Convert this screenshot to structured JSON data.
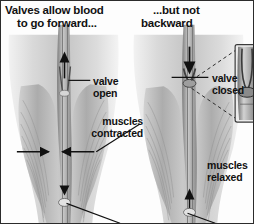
{
  "figure": {
    "panels": [
      {
        "id": "left",
        "title_line1": "Valves allow blood",
        "title_line2": "to go forward...",
        "flow_direction": "upward",
        "labels": [
          {
            "name": "valve-open",
            "line1": "valve",
            "line2": "open"
          },
          {
            "name": "muscles-contracted",
            "line1": "muscles",
            "line2": "contracted"
          }
        ]
      },
      {
        "id": "right",
        "title_line1": "...but not",
        "title_line2": "backward",
        "flow_direction": "downward",
        "labels": [
          {
            "name": "valve-closed",
            "line1": "valve",
            "line2": "closed"
          },
          {
            "name": "muscles-relaxed",
            "line1": "muscles",
            "line2": "relaxed"
          }
        ]
      }
    ],
    "colors": {
      "text": "#111111",
      "leader_line": "#1a1a1a",
      "muscle_fill": "#b9b9b9",
      "vein_fill": "#8d8d8d",
      "background": "#fdfdfd",
      "border": "#2b2b2b"
    }
  }
}
